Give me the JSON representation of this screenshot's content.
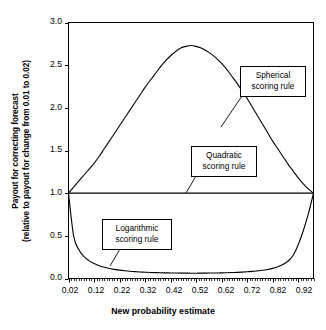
{
  "chart_data": {
    "type": "line",
    "title": "",
    "xlabel": "New probability estimate",
    "ylabel_line1": "Payout for correcting forecast",
    "ylabel_line2": "(relative to payout for change from 0.01 to 0.02)",
    "xlim": [
      0.02,
      0.98
    ],
    "ylim": [
      0.0,
      3.0
    ],
    "grid": false,
    "legend_position": "annotations-as-callouts",
    "xticks": [
      "0.02",
      "0.12",
      "0.22",
      "0.32",
      "0.42",
      "0.52",
      "0.62",
      "0.72",
      "0.82",
      "0.92"
    ],
    "xtick_values": [
      0.02,
      0.12,
      0.22,
      0.32,
      0.42,
      0.52,
      0.62,
      0.72,
      0.82,
      0.92
    ],
    "yticks": [
      "0.0",
      "0.5",
      "1.0",
      "1.5",
      "2.0",
      "2.5",
      "3.0"
    ],
    "ytick_values": [
      0.0,
      0.5,
      1.0,
      1.5,
      2.0,
      2.5,
      3.0
    ],
    "x": [
      0.02,
      0.04,
      0.06,
      0.08,
      0.1,
      0.12,
      0.14,
      0.16,
      0.18,
      0.2,
      0.22,
      0.24,
      0.26,
      0.28,
      0.3,
      0.32,
      0.34,
      0.36,
      0.38,
      0.4,
      0.42,
      0.44,
      0.46,
      0.48,
      0.5,
      0.52,
      0.54,
      0.56,
      0.58,
      0.6,
      0.62,
      0.64,
      0.66,
      0.68,
      0.7,
      0.72,
      0.74,
      0.76,
      0.78,
      0.8,
      0.82,
      0.84,
      0.86,
      0.88,
      0.9,
      0.92,
      0.94,
      0.96,
      0.98
    ],
    "series": [
      {
        "name": "Spherical scoring rule",
        "peak_value": 2.73,
        "peak_x": 0.48,
        "values": [
          1.0,
          1.07,
          1.14,
          1.21,
          1.28,
          1.35,
          1.43,
          1.52,
          1.61,
          1.7,
          1.79,
          1.88,
          1.97,
          2.06,
          2.15,
          2.24,
          2.32,
          2.4,
          2.48,
          2.55,
          2.61,
          2.66,
          2.7,
          2.72,
          2.73,
          2.72,
          2.7,
          2.67,
          2.63,
          2.58,
          2.52,
          2.45,
          2.37,
          2.29,
          2.2,
          2.11,
          2.01,
          1.91,
          1.81,
          1.71,
          1.61,
          1.52,
          1.43,
          1.34,
          1.26,
          1.18,
          1.11,
          1.05,
          1.0
        ]
      },
      {
        "name": "Quadratic scoring rule",
        "constant_value": 1.0,
        "values": [
          1.0,
          1.0,
          1.0,
          1.0,
          1.0,
          1.0,
          1.0,
          1.0,
          1.0,
          1.0,
          1.0,
          1.0,
          1.0,
          1.0,
          1.0,
          1.0,
          1.0,
          1.0,
          1.0,
          1.0,
          1.0,
          1.0,
          1.0,
          1.0,
          1.0,
          1.0,
          1.0,
          1.0,
          1.0,
          1.0,
          1.0,
          1.0,
          1.0,
          1.0,
          1.0,
          1.0,
          1.0,
          1.0,
          1.0,
          1.0,
          1.0,
          1.0,
          1.0,
          1.0,
          1.0,
          1.0,
          1.0,
          1.0,
          1.0
        ]
      },
      {
        "name": "Logarithmic scoring rule",
        "min_value": 0.06,
        "values": [
          1.0,
          0.5,
          0.34,
          0.26,
          0.21,
          0.175,
          0.15,
          0.132,
          0.118,
          0.107,
          0.098,
          0.091,
          0.085,
          0.081,
          0.077,
          0.074,
          0.071,
          0.069,
          0.067,
          0.066,
          0.065,
          0.064,
          0.063,
          0.063,
          0.062,
          0.062,
          0.063,
          0.063,
          0.064,
          0.065,
          0.066,
          0.068,
          0.07,
          0.072,
          0.075,
          0.079,
          0.083,
          0.089,
          0.096,
          0.106,
          0.119,
          0.137,
          0.163,
          0.203,
          0.27,
          0.395,
          0.56,
          0.76,
          1.0
        ]
      }
    ],
    "annotations": [
      {
        "id": "spherical",
        "line1": "Spherical",
        "line2": "scoring rule"
      },
      {
        "id": "quadratic",
        "line1": "Quadratic",
        "line2": "scoring rule"
      },
      {
        "id": "logarithmic",
        "line1": "Logarithmic",
        "line2": "scoring rule"
      }
    ]
  }
}
